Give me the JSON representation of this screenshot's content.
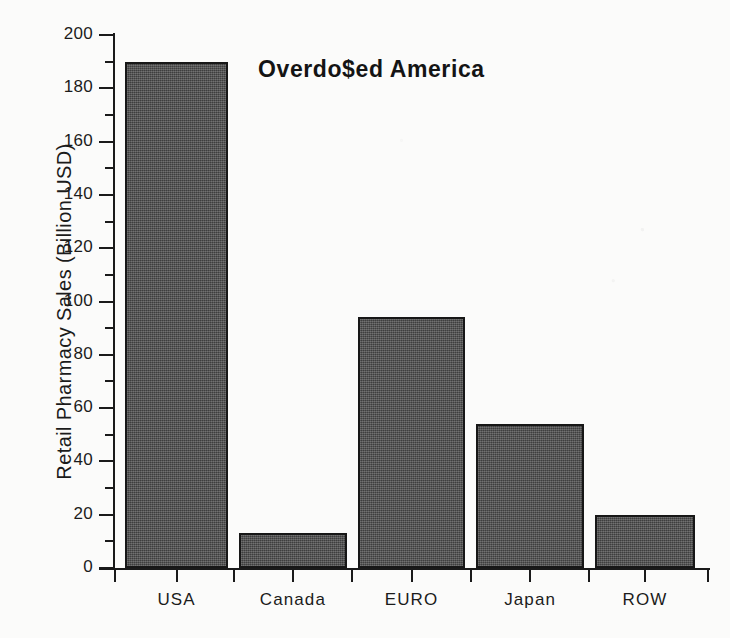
{
  "chart_data": {
    "type": "bar",
    "title": "Overdo$ed America",
    "xlabel": "",
    "ylabel": "Retail Pharmacy Sales (Billion USD)",
    "categories": [
      "USA",
      "Canada",
      "EURO",
      "Japan",
      "ROW"
    ],
    "values": [
      190,
      13,
      94,
      54,
      20
    ],
    "ylim": [
      0,
      200
    ],
    "y_major_ticks": [
      0,
      20,
      40,
      60,
      80,
      100,
      120,
      140,
      160,
      180,
      200
    ],
    "y_minor_ticks": [
      10,
      30,
      50,
      70,
      90,
      110,
      130,
      150,
      170,
      190
    ],
    "y_tick_labels": [
      "0",
      "20",
      "40",
      "60",
      "80",
      "100",
      "120",
      "140",
      "160",
      "180",
      "200"
    ],
    "grid": false,
    "legend": false,
    "legend_position": "none",
    "bar_color": "#4b4b4b",
    "bar_edge_color": "#171717",
    "axis_color": "#1a1a1a",
    "background_color": "#fbfbfa",
    "text_color": "#1b1b1b",
    "title_color": "#141414"
  }
}
